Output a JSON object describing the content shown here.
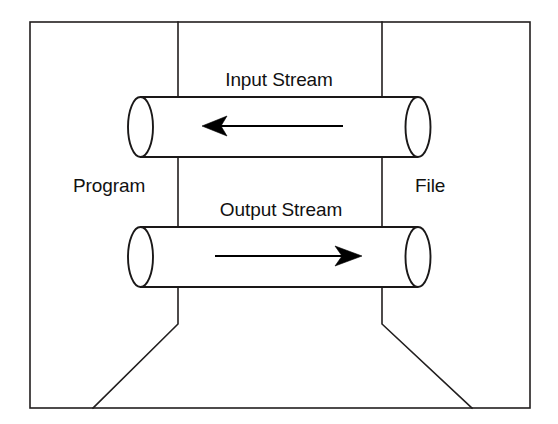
{
  "diagram": {
    "background_color": "#ffffff",
    "line_color": "#221f1f",
    "text_color": "#111111",
    "labels": {
      "input_stream": "Input Stream",
      "output_stream": "Output Stream",
      "program": "Program",
      "file": "File"
    },
    "nodes": [
      {
        "id": "program",
        "label": "Program",
        "side": "left"
      },
      {
        "id": "file",
        "label": "File",
        "side": "right"
      }
    ],
    "streams": [
      {
        "id": "input-stream",
        "label": "Input Stream",
        "direction": "right-to-left",
        "from": "File",
        "to": "Program",
        "arrow_icon": "arrow-left-icon"
      },
      {
        "id": "output-stream",
        "label": "Output Stream",
        "direction": "left-to-right",
        "from": "Program",
        "to": "File",
        "arrow_icon": "arrow-right-icon"
      }
    ],
    "geometry": {
      "frame": {
        "x": 30,
        "y": 22,
        "width": 500,
        "height": 386
      },
      "left_divider_x": 178,
      "right_divider_x": 382,
      "funnel_bend_y": 324,
      "funnel_left_bottom_x": 93,
      "funnel_right_bottom_x": 472,
      "top_tube": {
        "left": 128,
        "right": 430,
        "top": 97,
        "bottom": 157
      },
      "bottom_tube": {
        "left": 128,
        "right": 430,
        "top": 227,
        "bottom": 287
      }
    }
  }
}
